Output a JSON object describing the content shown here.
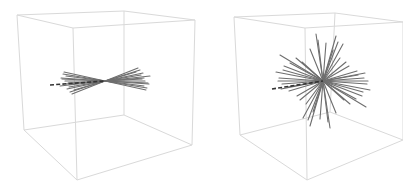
{
  "figure": {
    "panels": [
      {
        "id": "left",
        "description": "3D wireframe box with a flat fan of line segments through the center",
        "colors": {
          "box": "#d9d9d9",
          "spokes": "#6e6e6e",
          "dashed": "#333333"
        },
        "box_vertices": {
          "top": [
            [
              17,
              15
            ],
            [
              124,
              11
            ],
            [
              195,
              20
            ],
            [
              73,
              28
            ]
          ],
          "bottom": [
            [
              24,
              130
            ],
            [
              124,
              115
            ],
            [
              192,
              145
            ],
            [
              77,
              180
            ]
          ]
        },
        "center": [
          105,
          81
        ],
        "dashed_line": {
          "from": [
            50,
            85
          ],
          "to": [
            105,
            81
          ]
        },
        "spokes": [
          [
            64,
            72,
            146,
            90
          ],
          [
            66,
            76,
            144,
            86
          ],
          [
            62,
            79,
            148,
            83
          ],
          [
            68,
            83,
            142,
            79
          ],
          [
            60,
            86,
            150,
            76
          ],
          [
            67,
            89,
            143,
            73
          ],
          [
            70,
            92,
            140,
            70
          ],
          [
            72,
            94,
            138,
            68
          ],
          [
            63,
            74,
            147,
            88
          ],
          [
            65,
            81,
            145,
            81
          ],
          [
            69,
            87,
            141,
            75
          ],
          [
            61,
            78,
            149,
            84
          ],
          [
            74,
            90,
            136,
            72
          ],
          [
            66,
            84,
            144,
            78
          ]
        ]
      },
      {
        "id": "right",
        "description": "3D wireframe box with a 3D starburst of line segments through the center",
        "colors": {
          "box": "#d9d9d9",
          "spokes": "#6e6e6e",
          "dashed": "#333333"
        },
        "box_vertices": {
          "top": [
            [
              234,
              17
            ],
            [
              335,
              13
            ],
            [
              403,
              22
            ],
            [
              305,
              28
            ]
          ],
          "bottom": [
            [
              240,
              135
            ],
            [
              330,
              112
            ],
            [
              403,
              140
            ],
            [
              307,
              180
            ]
          ]
        },
        "center": [
          323,
          81
        ],
        "dashed_line": {
          "from": [
            272,
            89
          ],
          "to": [
            323,
            81
          ]
        },
        "spokes": [
          [
            316,
            34,
            330,
            128
          ],
          [
            336,
            36,
            310,
            126
          ],
          [
            343,
            44,
            303,
            118
          ],
          [
            326,
            43,
            320,
            119
          ],
          [
            280,
            55,
            366,
            107
          ],
          [
            296,
            58,
            350,
            104
          ],
          [
            284,
            66,
            362,
            96
          ],
          [
            276,
            72,
            370,
            90
          ],
          [
            279,
            78,
            367,
            84
          ],
          [
            282,
            84,
            364,
            78
          ],
          [
            289,
            91,
            357,
            71
          ],
          [
            297,
            96,
            349,
            66
          ],
          [
            306,
            104,
            340,
            58
          ],
          [
            358,
            75,
            288,
            87
          ],
          [
            365,
            73,
            281,
            89
          ],
          [
            368,
            81,
            278,
            81
          ],
          [
            363,
            92,
            283,
            70
          ],
          [
            356,
            99,
            290,
            63
          ],
          [
            310,
            49,
            336,
            113
          ],
          [
            333,
            50,
            313,
            112
          ],
          [
            346,
            62,
            300,
            100
          ],
          [
            302,
            62,
            344,
            100
          ],
          [
            318,
            40,
            328,
            122
          ],
          [
            338,
            42,
            308,
            120
          ]
        ]
      }
    ]
  }
}
